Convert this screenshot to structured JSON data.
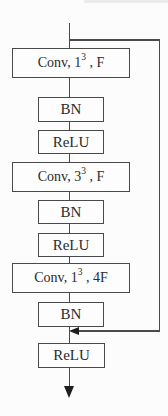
{
  "diagram": {
    "kind": "flowchart",
    "colors": {
      "background": "#fcfcfc",
      "line": "#4a4a4a",
      "arrowhead": "#1e1e1e",
      "text": "#2b2b2b",
      "box_fill": "#fdfdfd"
    },
    "nodes": [
      {
        "id": "conv-1x1x1-F",
        "type": "conv",
        "prefix": "Conv, 1",
        "sup": "3",
        "rest": " , F"
      },
      {
        "id": "bn-1",
        "type": "bn",
        "label": "BN"
      },
      {
        "id": "relu-1",
        "type": "relu",
        "label": "ReLU"
      },
      {
        "id": "conv-3x3x3-F",
        "type": "conv",
        "prefix": "Conv, 3",
        "sup": "3",
        "rest": " , F"
      },
      {
        "id": "bn-2",
        "type": "bn",
        "label": "BN"
      },
      {
        "id": "relu-2",
        "type": "relu",
        "label": "ReLU"
      },
      {
        "id": "conv-1x1x1-4F",
        "type": "conv",
        "prefix": "Conv, 1",
        "sup": "3",
        "rest": " , 4F"
      },
      {
        "id": "bn-3",
        "type": "bn",
        "label": "BN"
      },
      {
        "id": "relu-3",
        "type": "relu",
        "label": "ReLU"
      }
    ],
    "edges": [
      {
        "from": "input",
        "to": "conv-1x1x1-F"
      },
      {
        "from": "conv-1x1x1-F",
        "to": "bn-1"
      },
      {
        "from": "bn-1",
        "to": "relu-1"
      },
      {
        "from": "relu-1",
        "to": "conv-3x3x3-F"
      },
      {
        "from": "conv-3x3x3-F",
        "to": "bn-2"
      },
      {
        "from": "bn-2",
        "to": "relu-2"
      },
      {
        "from": "relu-2",
        "to": "conv-1x1x1-4F"
      },
      {
        "from": "conv-1x1x1-4F",
        "to": "bn-3"
      },
      {
        "from": "bn-3",
        "to": "relu-3"
      },
      {
        "from": "relu-3",
        "to": "output",
        "arrowhead": "down"
      },
      {
        "from": "input",
        "to": "bn-3/relu-3 junction",
        "type": "skip-connection",
        "arrowhead": "left"
      }
    ]
  }
}
